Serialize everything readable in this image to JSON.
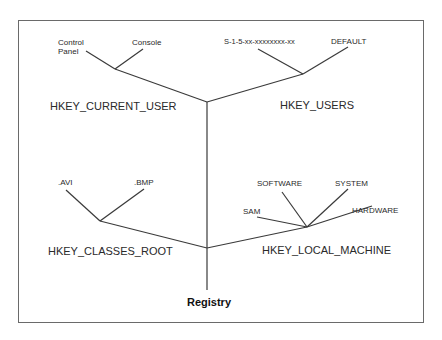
{
  "diagram": {
    "root": {
      "label": "Registry"
    },
    "hives": [
      {
        "name": "HKEY_CURRENT_USER",
        "children": [
          "Control Panel",
          "Console"
        ]
      },
      {
        "name": "HKEY_USERS",
        "children": [
          "S-1-5-xx-xxxxxxxx-xx",
          "DEFAULT"
        ]
      },
      {
        "name": "HKEY_CLASSES_ROOT",
        "children": [
          ".AVI",
          ".BMP"
        ]
      },
      {
        "name": "HKEY_LOCAL_MACHINE",
        "children": [
          "SAM",
          "SOFTWARE",
          "SYSTEM",
          "HARDWARE"
        ]
      }
    ],
    "labels": {
      "control_panel_l1": "Control",
      "control_panel_l2": "Panel",
      "console": "Console",
      "sid": "S-1-5-xx-xxxxxxxx-xx",
      "default": "DEFAULT",
      "avi": ".AVI",
      "bmp": ".BMP",
      "sam": "SAM",
      "software": "SOFTWARE",
      "system": "SYSTEM",
      "hardware": "HARDWARE"
    },
    "line_color": "#3a3a3a"
  }
}
